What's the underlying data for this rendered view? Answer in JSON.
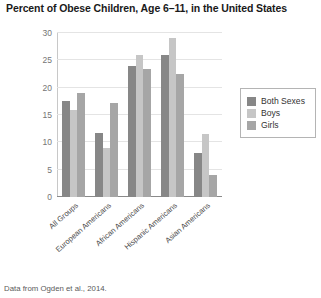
{
  "title": "Percent of Obese Children, Age 6–11, in the United States",
  "caption": "Data from Ogden et al., 2014.",
  "legend": {
    "items": [
      {
        "label": "Both Sexes",
        "color": "#878787"
      },
      {
        "label": "Boys",
        "color": "#c6c6c6"
      },
      {
        "label": "Girls",
        "color": "#a6a6a6"
      }
    ]
  },
  "chart_data": {
    "type": "bar",
    "title": "Percent of Obese Children, Age 6–11, in the United States",
    "xlabel": "",
    "ylabel": "",
    "ylim": [
      0,
      30
    ],
    "yticks": [
      0,
      5,
      10,
      15,
      20,
      25,
      30
    ],
    "grid": true,
    "legend_position": "right",
    "categories": [
      "All Groups",
      "European Americans",
      "African Americans",
      "Hispanic Americans",
      "Asian Americans"
    ],
    "series": [
      {
        "name": "Both Sexes",
        "color": "#878787",
        "values": [
          17.5,
          11.8,
          24.0,
          26.0,
          8.0
        ]
      },
      {
        "name": "Boys",
        "color": "#c6c6c6",
        "values": [
          16.0,
          9.0,
          26.0,
          29.0,
          11.5
        ]
      },
      {
        "name": "Girls",
        "color": "#a6a6a6",
        "values": [
          19.0,
          17.2,
          23.5,
          22.5,
          4.0
        ]
      }
    ]
  }
}
